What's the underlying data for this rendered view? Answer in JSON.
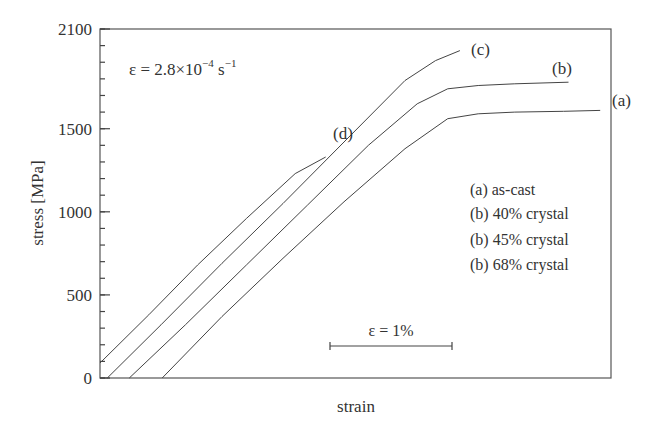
{
  "chart_data": {
    "type": "line",
    "title": "",
    "annotation_rate": "ε = 2.8×10⁻⁴ s⁻¹",
    "annotation_rate_parts": {
      "base": "ε = 2.8×10",
      "exp1": "−4",
      "unit": " s",
      "exp2": "−1"
    },
    "xlabel": "strain",
    "ylabel": "stress [MPa]",
    "ylim": [
      0,
      2100
    ],
    "yticks": [
      0,
      500,
      1000,
      1500,
      2100
    ],
    "ytick_labels": [
      "0",
      "500",
      "1000",
      "1500",
      "2100"
    ],
    "y_minor_step": 100,
    "x_units": "strain % (relative, curves offset; scale bar ε = 1%)",
    "scale_bar": {
      "label": "ε = 1%",
      "length_strain_percent": 1
    },
    "grid": false,
    "legend_position": "inside right",
    "legend": [
      "(a) as-cast",
      "(b) 40% crystal",
      "(b) 45% crystal",
      "(b) 68% crystal"
    ],
    "series": [
      {
        "name": "(a) as-cast",
        "label": "(a)",
        "x": [
          0.51,
          1.0,
          1.5,
          2.0,
          2.5,
          2.85,
          3.1,
          3.4,
          3.8,
          4.1
        ],
        "y": [
          0,
          370,
          720,
          1060,
          1380,
          1560,
          1590,
          1600,
          1605,
          1610
        ]
      },
      {
        "name": "(b) 40% crystal",
        "label": "(b)",
        "x": [
          0.24,
          0.7,
          1.2,
          1.7,
          2.2,
          2.6,
          2.85,
          3.1,
          3.4,
          3.84
        ],
        "y": [
          0,
          320,
          680,
          1040,
          1400,
          1650,
          1740,
          1760,
          1770,
          1780
        ]
      },
      {
        "name": "(b) 45% crystal",
        "label": "(c)",
        "x": [
          0.06,
          0.5,
          1.0,
          1.5,
          2.0,
          2.5,
          2.75,
          2.95
        ],
        "y": [
          0,
          320,
          690,
          1050,
          1420,
          1790,
          1910,
          1970
        ]
      },
      {
        "name": "(b) 68% crystal",
        "label": "(d)",
        "x": [
          0.0,
          0.4,
          0.8,
          1.2,
          1.6,
          1.85
        ],
        "y": [
          90,
          380,
          680,
          960,
          1230,
          1330
        ]
      }
    ]
  }
}
